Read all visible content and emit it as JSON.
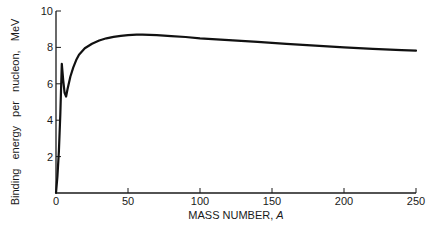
{
  "chart_data": {
    "type": "line",
    "title": "",
    "xlabel": "MASS NUMBER, ",
    "xlabel_italic": "A",
    "ylabel_words": [
      "Binding",
      "energy",
      "per",
      "nucleon,",
      "MeV"
    ],
    "xlim": [
      0,
      250
    ],
    "ylim": [
      0,
      10
    ],
    "x_ticks": [
      0,
      50,
      100,
      150,
      200,
      250
    ],
    "y_ticks": [
      2,
      4,
      6,
      8,
      10
    ],
    "grid": false,
    "legend": null,
    "series": [
      {
        "name": "Binding energy per nucleon",
        "x": [
          0,
          1,
          2,
          3,
          4,
          5,
          6,
          7,
          8,
          10,
          12,
          14,
          16,
          20,
          25,
          30,
          35,
          40,
          45,
          50,
          56,
          60,
          70,
          80,
          90,
          100,
          120,
          140,
          160,
          180,
          200,
          220,
          240,
          250
        ],
        "values": [
          0,
          0.9,
          2.3,
          4.3,
          7.1,
          6.2,
          5.5,
          5.3,
          5.7,
          6.4,
          6.9,
          7.3,
          7.6,
          7.95,
          8.2,
          8.38,
          8.5,
          8.58,
          8.63,
          8.67,
          8.7,
          8.7,
          8.67,
          8.62,
          8.57,
          8.5,
          8.4,
          8.3,
          8.2,
          8.1,
          8.0,
          7.92,
          7.85,
          7.82
        ]
      }
    ]
  },
  "colors": {
    "line": "#111111",
    "axis": "#1a1a1a",
    "background": "#ffffff"
  }
}
